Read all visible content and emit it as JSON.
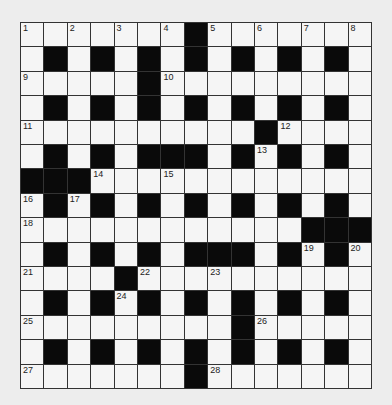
{
  "puzzle": {
    "rows": 15,
    "cols": 15,
    "colors": {
      "background": "#ededed",
      "cell": "#f5f5f5",
      "block": "#0a0a0a",
      "line": "#333333"
    },
    "layout": [
      "WWWWWWWBWWWWWWW",
      "WBWBWBWBWBWBWBW",
      "WWWWWBWWWWWWWWW",
      "WBWBWBWBWBWBWBW",
      "WWWWWWWWWWBWWWW",
      "WBWBWBBBWBWBWBW",
      "BBBWWWWWWWWWWWW",
      "WBWBWBWBWBWBWBW",
      "WWWWWWWWWWWWBBB",
      "WBWBWBWBBBWBWBW",
      "WWWWBWWWWWWWWWW",
      "WBWBWBWBWBWBWBW",
      "WWWWWWWWWBWWWWW",
      "WBWBWBWBWBWBWBW",
      "WWWWWWWBWWWWWWW"
    ],
    "numbers": [
      {
        "r": 0,
        "c": 0,
        "n": "1"
      },
      {
        "r": 0,
        "c": 2,
        "n": "2"
      },
      {
        "r": 0,
        "c": 4,
        "n": "3"
      },
      {
        "r": 0,
        "c": 6,
        "n": "4"
      },
      {
        "r": 0,
        "c": 8,
        "n": "5"
      },
      {
        "r": 0,
        "c": 10,
        "n": "6"
      },
      {
        "r": 0,
        "c": 12,
        "n": "7"
      },
      {
        "r": 0,
        "c": 14,
        "n": "8"
      },
      {
        "r": 2,
        "c": 0,
        "n": "9"
      },
      {
        "r": 2,
        "c": 6,
        "n": "10"
      },
      {
        "r": 4,
        "c": 0,
        "n": "11"
      },
      {
        "r": 4,
        "c": 11,
        "n": "12"
      },
      {
        "r": 5,
        "c": 10,
        "n": "13"
      },
      {
        "r": 6,
        "c": 3,
        "n": "14"
      },
      {
        "r": 6,
        "c": 6,
        "n": "15"
      },
      {
        "r": 7,
        "c": 0,
        "n": "16"
      },
      {
        "r": 7,
        "c": 2,
        "n": "17"
      },
      {
        "r": 8,
        "c": 0,
        "n": "18"
      },
      {
        "r": 9,
        "c": 12,
        "n": "19"
      },
      {
        "r": 9,
        "c": 14,
        "n": "20"
      },
      {
        "r": 10,
        "c": 0,
        "n": "21"
      },
      {
        "r": 10,
        "c": 5,
        "n": "22"
      },
      {
        "r": 10,
        "c": 8,
        "n": "23"
      },
      {
        "r": 11,
        "c": 4,
        "n": "24"
      },
      {
        "r": 12,
        "c": 0,
        "n": "25"
      },
      {
        "r": 12,
        "c": 10,
        "n": "26"
      },
      {
        "r": 14,
        "c": 0,
        "n": "27"
      },
      {
        "r": 14,
        "c": 8,
        "n": "28"
      }
    ]
  }
}
